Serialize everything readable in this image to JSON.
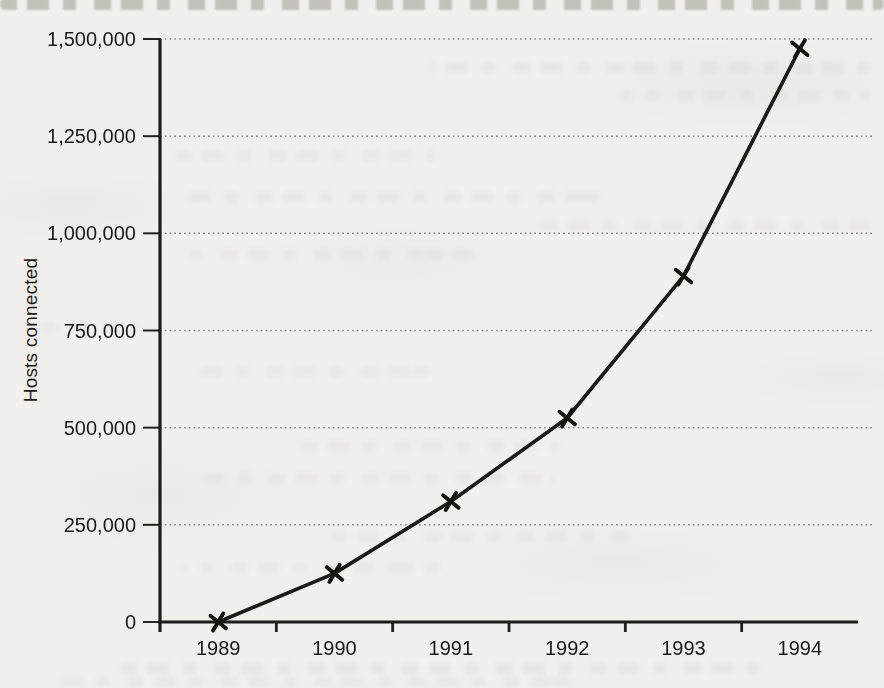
{
  "figure": {
    "kind": "scanned book figure",
    "background_color": "#f1efec",
    "ink_color": "#1d1b19"
  },
  "chart_data": {
    "type": "line",
    "title": "",
    "xlabel": "",
    "ylabel": "Hosts connected",
    "categories": [
      "1989",
      "1990",
      "1991",
      "1992",
      "1993",
      "1994"
    ],
    "series_name": "Hosts connected",
    "values": [
      0,
      125000,
      310000,
      525000,
      890000,
      1475000
    ],
    "ylim": [
      0,
      1500000
    ],
    "yticks": [
      1500000,
      1250000,
      1000000,
      750000,
      500000,
      250000,
      0
    ],
    "ytick_labels": [
      "1,500,000",
      "1,250,000",
      "1,000,000",
      "750,000",
      "500,000",
      "250,000",
      "0"
    ],
    "grid": "horizontal dotted",
    "legend": "none",
    "marker": "x",
    "line_color": "#1d1b19",
    "grid_color": "#8f8d89"
  }
}
